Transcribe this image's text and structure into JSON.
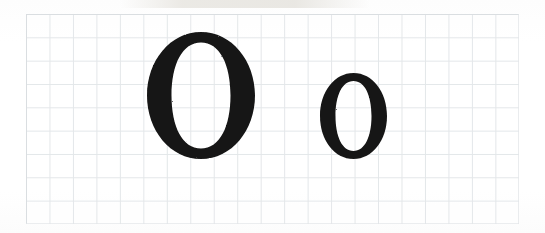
{
  "image": {
    "kind": "scanned-handwriting-worksheet",
    "description": "Scanned grid paper sheet showing a large uppercase letter and a smaller lowercase letter",
    "width": 545,
    "height": 233,
    "background_color": "#ffffff",
    "paper_color": "#fefefe"
  },
  "grid": {
    "label": "graph-paper-grid",
    "line_color": "#dfe3e6",
    "border_color": "#d8dcdf",
    "cell_size_px": 23.4,
    "columns": 21,
    "rows": 9,
    "left": 26,
    "top": 14,
    "width": 493,
    "height": 210
  },
  "glyphs": [
    {
      "name": "uppercase-o",
      "character": "O",
      "case": "uppercase",
      "ink_color": "#141414",
      "left": 147,
      "top": 32,
      "width": 108,
      "height": 127,
      "stroke_style": "serif-modulated",
      "thick_stroke_px": 23,
      "thin_stroke_px": 9
    },
    {
      "name": "lowercase-o",
      "character": "o",
      "case": "lowercase",
      "ink_color": "#141414",
      "left": 320,
      "top": 73,
      "width": 67,
      "height": 86,
      "stroke_style": "serif-modulated",
      "thick_stroke_px": 16,
      "thin_stroke_px": 7
    }
  ],
  "colors": {
    "ink": "#141414",
    "grid_line": "#dfe3e6",
    "paper": "#fefefe",
    "page_background": "#ffffff",
    "smudge": "#e9e7e2"
  }
}
